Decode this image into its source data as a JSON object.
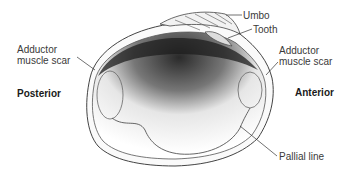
{
  "diagram": {
    "labels": {
      "umbo": "Umbo",
      "tooth": "Tooth",
      "adductor_left_line1": "Adductor",
      "adductor_left_line2": "muscle scar",
      "adductor_right_line1": "Adductor",
      "adductor_right_line2": "muscle scar",
      "posterior": "Posterior",
      "anterior": "Anterior",
      "pallial_line": "Pallial line"
    },
    "colors": {
      "ink": "#333333",
      "shading": "#222222",
      "background": "#ffffff"
    }
  }
}
